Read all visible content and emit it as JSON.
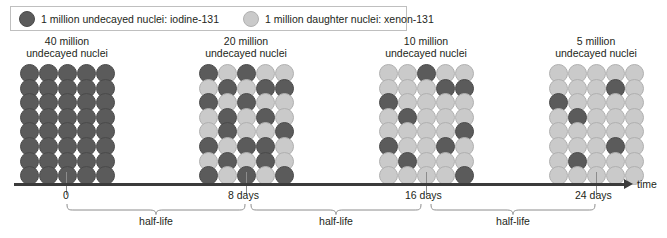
{
  "legend": {
    "entries": [
      {
        "swatch": "dark",
        "color": "#5b5b5b",
        "text": "1 million undecayed nuclei: iodine-131"
      },
      {
        "swatch": "light",
        "color": "#cacaca",
        "text": "1 million daughter nuclei: xenon-131"
      }
    ]
  },
  "groups": [
    {
      "id": "group-0-days",
      "title": "40 million\nundecayed nuclei",
      "undecayed_count": 40,
      "daughter_count": 0,
      "columns": 5,
      "rows": 8,
      "cells": [
        "dark",
        "dark",
        "dark",
        "dark",
        "dark",
        "dark",
        "dark",
        "dark",
        "dark",
        "dark",
        "dark",
        "dark",
        "dark",
        "dark",
        "dark",
        "dark",
        "dark",
        "dark",
        "dark",
        "dark",
        "dark",
        "dark",
        "dark",
        "dark",
        "dark",
        "dark",
        "dark",
        "dark",
        "dark",
        "dark",
        "dark",
        "dark",
        "dark",
        "dark",
        "dark",
        "dark",
        "dark",
        "dark",
        "dark",
        "dark"
      ]
    },
    {
      "id": "group-8-days",
      "title": "20 million\nundecayed nuclei",
      "undecayed_count": 20,
      "daughter_count": 20,
      "columns": 5,
      "rows": 8,
      "cells": [
        "dark",
        "light",
        "dark",
        "light",
        "light",
        "light",
        "dark",
        "light",
        "dark",
        "dark",
        "dark",
        "light",
        "dark",
        "light",
        "light",
        "light",
        "dark",
        "light",
        "dark",
        "light",
        "light",
        "dark",
        "light",
        "light",
        "dark",
        "dark",
        "light",
        "dark",
        "dark",
        "light",
        "light",
        "dark",
        "light",
        "dark",
        "light",
        "dark",
        "light",
        "dark",
        "light",
        "dark"
      ]
    },
    {
      "id": "group-16-days",
      "title": "10 million\nundecayed nuclei",
      "undecayed_count": 10,
      "daughter_count": 30,
      "columns": 5,
      "rows": 8,
      "cells": [
        "light",
        "light",
        "dark",
        "light",
        "light",
        "light",
        "light",
        "light",
        "dark",
        "dark",
        "dark",
        "light",
        "light",
        "light",
        "light",
        "light",
        "dark",
        "light",
        "light",
        "light",
        "light",
        "light",
        "light",
        "light",
        "dark",
        "dark",
        "light",
        "light",
        "dark",
        "light",
        "light",
        "dark",
        "light",
        "light",
        "light",
        "light",
        "light",
        "light",
        "light",
        "dark"
      ]
    },
    {
      "id": "group-24-days",
      "title": "5 million\nundecayed nuclei",
      "undecayed_count": 5,
      "daughter_count": 35,
      "columns": 5,
      "rows": 8,
      "cells": [
        "light",
        "light",
        "light",
        "light",
        "light",
        "light",
        "light",
        "light",
        "dark",
        "light",
        "dark",
        "light",
        "light",
        "light",
        "light",
        "light",
        "dark",
        "light",
        "light",
        "light",
        "light",
        "light",
        "light",
        "light",
        "light",
        "light",
        "light",
        "light",
        "dark",
        "light",
        "light",
        "dark",
        "light",
        "light",
        "light",
        "light",
        "light",
        "light",
        "light",
        "light"
      ]
    }
  ],
  "axis": {
    "label": "time",
    "ticks": [
      {
        "label": "0",
        "days": 0
      },
      {
        "label": "8 days",
        "days": 8
      },
      {
        "label": "16 days",
        "days": 16
      },
      {
        "label": "24 days",
        "days": 24
      }
    ]
  },
  "halflife": {
    "label": "half-life",
    "spans": [
      {
        "from": "0",
        "to": "8 days"
      },
      {
        "from": "8 days",
        "to": "16 days"
      },
      {
        "from": "16 days",
        "to": "24 days"
      }
    ]
  }
}
